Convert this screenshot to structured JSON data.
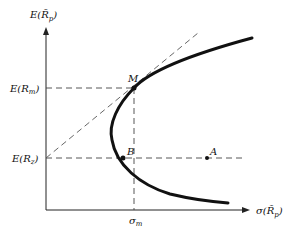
{
  "diagram": {
    "y_axis_label": "E(R̃p)",
    "x_axis_label": "σ(R̃p)",
    "y_ticks": [
      {
        "label": "E(Rm)",
        "y": 88
      },
      {
        "label": "E(Rz)",
        "y": 158
      }
    ],
    "x_ticks": [
      {
        "label": "σm",
        "x": 134
      }
    ],
    "points": [
      {
        "name": "M",
        "x": 134,
        "y": 88
      },
      {
        "name": "B",
        "x": 123,
        "y": 158
      },
      {
        "name": "A",
        "x": 207,
        "y": 158
      }
    ],
    "curve": "minimum-variance frontier",
    "tangent_line": "from E(Rz) through M",
    "colors": {
      "ink": "#111111",
      "dash": "#555555"
    }
  },
  "labels": {
    "y_axis": "E(R̃",
    "y_axis_sub": "p",
    "x_axis": "σ(R̃",
    "x_axis_sub": "p",
    "erm": "E(R",
    "erm_sub": "m",
    "erz": "E(R",
    "erz_sub": "z",
    "sigma": "σ",
    "sigma_sub": "m",
    "M": "M",
    "B": "B",
    "A": "A"
  }
}
